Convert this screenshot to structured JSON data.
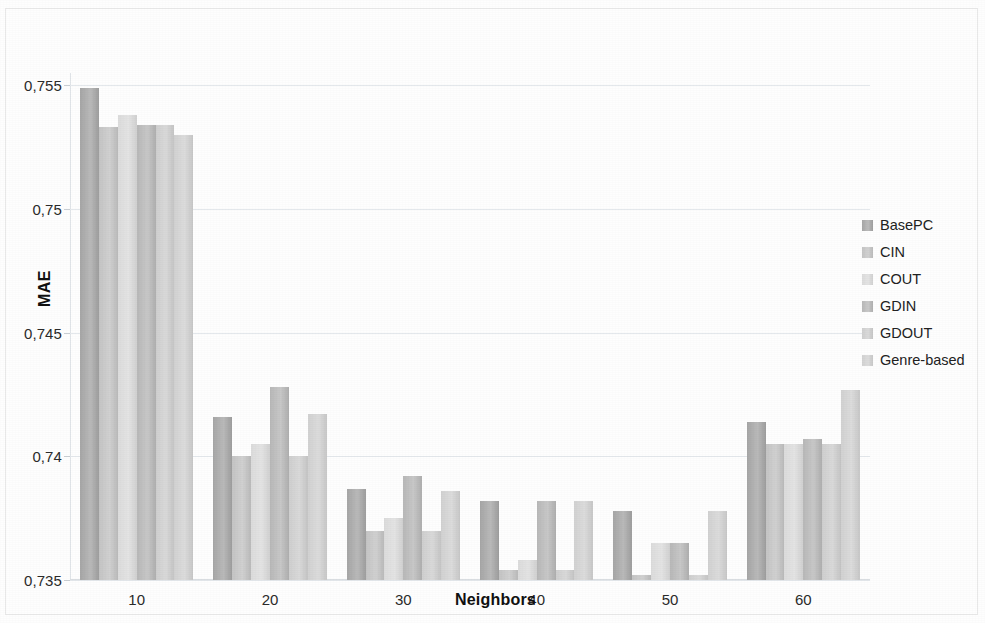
{
  "chart_data": {
    "type": "bar",
    "title": "",
    "xlabel": "Neighbors",
    "ylabel": "MAE",
    "categories": [
      "10",
      "20",
      "30",
      "40",
      "50",
      "60"
    ],
    "ylim": [
      0.735,
      0.7555
    ],
    "yticks": [
      0.735,
      0.74,
      0.745,
      0.75,
      0.755
    ],
    "ytick_labels": [
      "0,735",
      "0,74",
      "0,745",
      "0,75",
      "0,755"
    ],
    "grid": true,
    "legend_position": "right",
    "series": [
      {
        "name": "BasePC",
        "color": "#a6a6a6",
        "values": [
          0.7549,
          0.7416,
          0.7387,
          0.7382,
          0.7378,
          0.7414
        ]
      },
      {
        "name": "CIN",
        "color": "#c4c4c4",
        "values": [
          0.7533,
          0.74,
          0.737,
          0.7354,
          0.7352,
          0.7405
        ]
      },
      {
        "name": "COUT",
        "color": "#dcdcdc",
        "values": [
          0.7538,
          0.7405,
          0.7375,
          0.7358,
          0.7365,
          0.7405
        ]
      },
      {
        "name": "GDIN",
        "color": "#b8b8b8",
        "values": [
          0.7534,
          0.7428,
          0.7392,
          0.7382,
          0.7365,
          0.7407
        ]
      },
      {
        "name": "GDOUT",
        "color": "#cfcfcf",
        "values": [
          0.7534,
          0.74,
          0.737,
          0.7354,
          0.7352,
          0.7405
        ]
      },
      {
        "name": "Genre-based",
        "color": "#d2d2d2",
        "values": [
          0.753,
          0.7417,
          0.7386,
          0.7382,
          0.7378,
          0.7427
        ]
      }
    ]
  }
}
